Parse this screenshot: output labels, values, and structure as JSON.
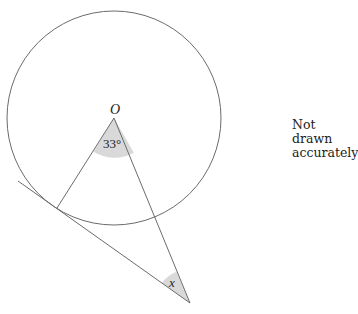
{
  "diagram": {
    "center_label": "O",
    "center_angle_label": "33°",
    "unknown_angle_label": "x",
    "note_line1": "Not drawn",
    "note_line2": "accurately"
  },
  "geometry": {
    "circle": {
      "cx": 114,
      "cy": 118,
      "r": 107
    },
    "center": {
      "x": 114,
      "y": 118
    },
    "tangent_point": {
      "x": 57,
      "y": 208
    },
    "external_point": {
      "x": 190,
      "y": 303
    },
    "tangent_line_start": {
      "x": 18,
      "y": 181
    },
    "center_angle_deg": 33
  },
  "colors": {
    "stroke": "#6b6b6b",
    "angle_fill": "#d9d9d9",
    "text": "#222222"
  }
}
